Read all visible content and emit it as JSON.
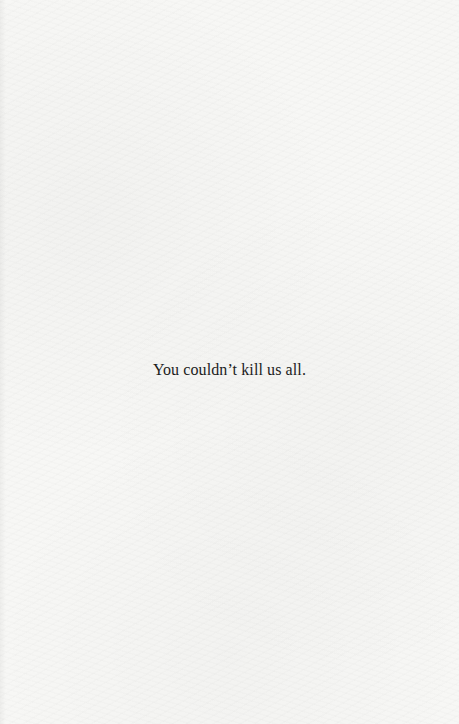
{
  "page": {
    "background_color": "#f7f7f5",
    "text_color": "#1c1c1c",
    "epigraph": "You couldn’t kill us all."
  }
}
